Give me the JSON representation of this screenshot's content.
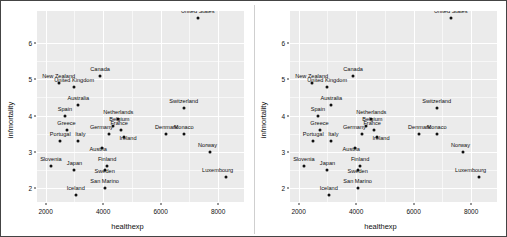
{
  "figure": {
    "background_color": "#ffffff",
    "border_color": "#444444",
    "panel_background": "#ebebeb",
    "gridline_color": "#ffffff",
    "point_color": "#101010"
  },
  "chart_data": {
    "type": "scatter",
    "title": "",
    "xlabel": "healthexp",
    "ylabel": "infmortality",
    "xlim": [
      1700,
      8900
    ],
    "ylim": [
      1.6,
      6.9
    ],
    "xticks": [
      2000,
      4000,
      6000,
      8000
    ],
    "yticks": [
      2,
      3,
      4,
      5,
      6
    ],
    "grid": true,
    "legend": "none",
    "panels": [
      {
        "id": "panel-left",
        "label": ""
      },
      {
        "id": "panel-right",
        "label": ""
      }
    ],
    "points": [
      {
        "name": "United States",
        "x": 7290,
        "y": 6.7,
        "dx": 0,
        "dy": -3
      },
      {
        "name": "Canada",
        "x": 3895,
        "y": 5.1,
        "dx": 0,
        "dy": -3
      },
      {
        "name": "New Zealand",
        "x": 2454,
        "y": 4.9,
        "dx": 0,
        "dy": -3
      },
      {
        "name": "United Kingdom",
        "x": 2992,
        "y": 4.8,
        "dx": 0,
        "dy": -3
      },
      {
        "name": "Switzerland",
        "x": 6800,
        "y": 4.2,
        "dx": 0,
        "dy": -3
      },
      {
        "name": "Australia",
        "x": 3137,
        "y": 4.3,
        "dx": 0,
        "dy": -3
      },
      {
        "name": "Spain",
        "x": 2671,
        "y": 4.0,
        "dx": 0,
        "dy": -3
      },
      {
        "name": "Netherlands",
        "x": 4528,
        "y": 3.9,
        "dx": 0,
        "dy": -3
      },
      {
        "name": "Belgium",
        "x": 4356,
        "y": 3.7,
        "dx": 6,
        "dy": -3
      },
      {
        "name": "Greece",
        "x": 2727,
        "y": 3.6,
        "dx": 0,
        "dy": -3
      },
      {
        "name": "Germany",
        "x": 4218,
        "y": 3.5,
        "dx": -8,
        "dy": -3
      },
      {
        "name": "France",
        "x": 4627,
        "y": 3.6,
        "dx": -2,
        "dy": -3
      },
      {
        "name": "Ireland",
        "x": 4728,
        "y": 3.4,
        "dx": 4,
        "dy": 5
      },
      {
        "name": "Denmark",
        "x": 6200,
        "y": 3.5,
        "dx": 0,
        "dy": -3
      },
      {
        "name": "Monaco",
        "x": 6800,
        "y": 3.5,
        "dx": 0,
        "dy": -3
      },
      {
        "name": "Portugal",
        "x": 2508,
        "y": 3.3,
        "dx": 0,
        "dy": -3
      },
      {
        "name": "Italy",
        "x": 3137,
        "y": 3.3,
        "dx": 2,
        "dy": -3
      },
      {
        "name": "Austria",
        "x": 3970,
        "y": 3.1,
        "dx": -4,
        "dy": 5
      },
      {
        "name": "Norway",
        "x": 7700,
        "y": 3.0,
        "dx": -2,
        "dy": -3
      },
      {
        "name": "Slovenia",
        "x": 2183,
        "y": 2.6,
        "dx": 0,
        "dy": -3
      },
      {
        "name": "Japan",
        "x": 3004,
        "y": 2.5,
        "dx": 0,
        "dy": -3
      },
      {
        "name": "Finland",
        "x": 4138,
        "y": 2.6,
        "dx": 0,
        "dy": -3
      },
      {
        "name": "Sweden",
        "x": 4054,
        "y": 2.5,
        "dx": 0,
        "dy": 5
      },
      {
        "name": "Luxembourg",
        "x": 8262,
        "y": 2.3,
        "dx": -8,
        "dy": -3
      },
      {
        "name": "San Marino",
        "x": 4053,
        "y": 2.0,
        "dx": 0,
        "dy": -3
      },
      {
        "name": "Iceland",
        "x": 3048,
        "y": 1.8,
        "dx": 0,
        "dy": -3
      }
    ]
  }
}
